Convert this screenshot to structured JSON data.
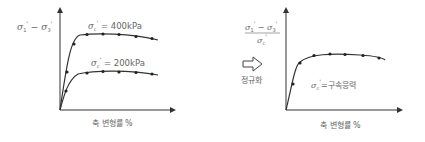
{
  "left_plot": {
    "ylabel": {
      "a": "σ",
      "a_sub": "1",
      "a_sup": "'",
      "op": " − ",
      "b": "σ",
      "b_sub": "3",
      "b_sup": "'"
    },
    "xlabel": "축 변형률 %",
    "curves": [
      {
        "label_sym": "σ",
        "label_sub": "c",
        "label_sup": "'",
        "label_val": " = 400kPa"
      },
      {
        "label_sym": "σ",
        "label_sub": "c",
        "label_sup": "'",
        "label_val": " = 200kPa"
      }
    ]
  },
  "arrow": {
    "label": "정규화"
  },
  "right_plot": {
    "ylabel_num": {
      "a": "σ",
      "a_sub": "1",
      "a_sup": "'",
      "op": " − ",
      "b": "σ",
      "b_sub": "3",
      "b_sup": "'"
    },
    "ylabel_den": {
      "a": "σ",
      "a_sub": "c",
      "a_sup": "'"
    },
    "annotation": {
      "sym": "σ",
      "sub": "c",
      "sup": "'",
      "text": "=구속응력"
    },
    "xlabel": "축 변형률 %"
  },
  "colors": {
    "line": "#333333",
    "text": "#666666"
  }
}
